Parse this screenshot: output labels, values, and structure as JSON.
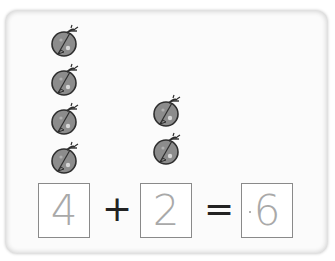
{
  "equation": {
    "addend1": "4",
    "plus": "+",
    "addend2": "2",
    "equals": "=",
    "sum": "6"
  },
  "groups": {
    "left_count": 4,
    "right_count": 2,
    "icon": "ladybug-icon"
  },
  "colors": {
    "bug_body": "#8c8c8c",
    "bug_outline": "#333333",
    "number_gray": "#a9a9a9",
    "box_border": "#8a8a8a"
  }
}
